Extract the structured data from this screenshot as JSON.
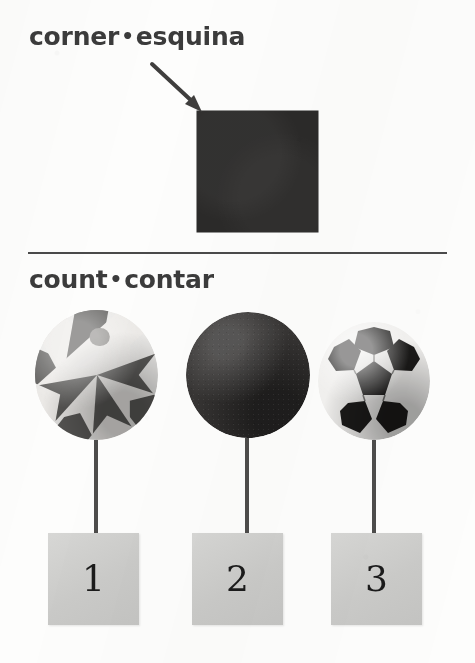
{
  "page": {
    "background_color": "#fdfdfc",
    "text_color": "#3b3b3b"
  },
  "entries": [
    {
      "english": "corner",
      "separator": "•",
      "spanish": "esquina",
      "heading_text": "corner • esquina",
      "illustration": {
        "name": "dark-square-with-pointer-arrow",
        "shape": "square",
        "fill_color": "#2b2a29",
        "annotation_icon": "arrow-icon",
        "arrow_points_to": "top-left corner of square"
      }
    },
    {
      "english": "count",
      "separator": "•",
      "spanish": "contar",
      "heading_text": "count • contar",
      "illustration": {
        "name": "three-balls-with-number-tiles",
        "items": [
          {
            "object": "beach ball",
            "icon": "beach-ball-icon",
            "number_label": "1",
            "tile_color": "#cfcfcd"
          },
          {
            "object": "playground ball",
            "icon": "solid-ball-icon",
            "number_label": "2",
            "tile_color": "#cfcfcd"
          },
          {
            "object": "soccer ball",
            "icon": "soccer-ball-icon",
            "number_label": "3",
            "tile_color": "#cfcfcd"
          }
        ]
      }
    }
  ],
  "divider": {
    "color": "#4a4a4a"
  }
}
